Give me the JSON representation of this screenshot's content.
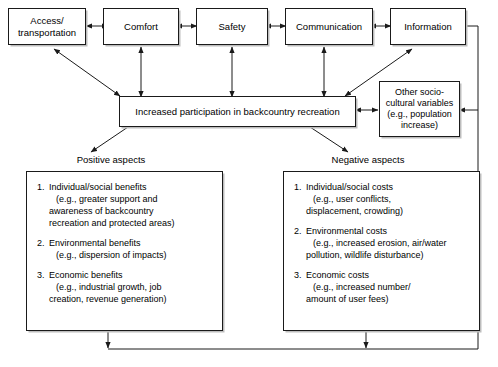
{
  "diagram": {
    "top_nodes": [
      {
        "id": "access",
        "label": "Access/\ntransportation"
      },
      {
        "id": "comfort",
        "label": "Comfort"
      },
      {
        "id": "safety",
        "label": "Safety"
      },
      {
        "id": "communication",
        "label": "Communication"
      },
      {
        "id": "information",
        "label": "Information"
      }
    ],
    "central_node": {
      "label": "Increased participation in backcountry recreation"
    },
    "side_node": {
      "label": "Other socio-\ncultural variables\n(e.g., population\nincrease)"
    },
    "branch_labels": {
      "positive": "Positive aspects",
      "negative": "Negative aspects"
    },
    "positive_items": [
      {
        "number": "1.",
        "title": "Individual/social benefits",
        "detail": "(e.g., greater support and\nawareness of backcountry\nrecreation and protected areas)"
      },
      {
        "number": "2.",
        "title": "Environmental benefits",
        "detail": "(e.g., dispersion of impacts)"
      },
      {
        "number": "3.",
        "title": "Economic benefits",
        "detail": "(e.g., industrial growth, job\ncreation, revenue generation)"
      }
    ],
    "negative_items": [
      {
        "number": "1.",
        "title": "Individual/social costs",
        "detail": "(e.g., user conflicts,\ndisplacement, crowding)"
      },
      {
        "number": "2.",
        "title": "Environmental costs",
        "detail": "(e.g., increased erosion, air/water\npollution, wildlife disturbance)"
      },
      {
        "number": "3.",
        "title": "Economic costs",
        "detail": "(e.g., increased number/\namount of user fees)"
      }
    ],
    "colors": {
      "line": "#1a1a1a",
      "box_border": "#1a1a1a",
      "shadow": "#bdbdbd",
      "background": "#ffffff",
      "text": "#000000"
    }
  }
}
